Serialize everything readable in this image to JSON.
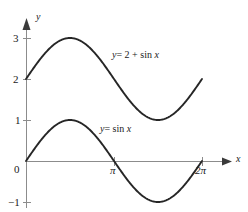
{
  "figure": {
    "kind": "math-plot",
    "background_color": "#ffffff",
    "stroke_color": "#262626",
    "axis_color": "#8c8c8c",
    "text_color": "#1a1a1a"
  },
  "axes": {
    "x_axis_label": "x",
    "y_axis_label": "y",
    "x_ticks": [
      {
        "label": "π",
        "value": 3.1416
      },
      {
        "label": "2π",
        "value": 6.2832
      }
    ],
    "y_ticks": [
      {
        "label": "3",
        "value": 3
      },
      {
        "label": "2",
        "value": 2
      },
      {
        "label": "1",
        "value": 1
      },
      {
        "label": "0",
        "value": 0
      },
      {
        "label": "−1",
        "value": -1
      }
    ]
  },
  "chart_data": {
    "type": "line",
    "title": "",
    "subtitle": "",
    "xlabel": "x",
    "ylabel": "y",
    "xlim": [
      0,
      6.2832
    ],
    "ylim": [
      -1.35,
      3.35
    ],
    "xticks": [
      3.1416,
      6.2832
    ],
    "xticklabels": [
      "π",
      "2π"
    ],
    "yticks": [
      -1,
      0,
      1,
      2,
      3
    ],
    "yticklabels": [
      "−1",
      "0",
      "1",
      "2",
      "3"
    ],
    "grid": false,
    "legend": "inline-annotations",
    "series": [
      {
        "name": "y = 2 + sin x",
        "expression": "2 + sin(x)",
        "color": "#262626",
        "amplitude": 1,
        "vertical_shift": 2,
        "x": [
          0,
          0.3927,
          0.7854,
          1.1781,
          1.5708,
          1.9635,
          2.3562,
          2.7489,
          3.1416,
          3.5343,
          3.927,
          4.3197,
          4.7124,
          5.1051,
          5.4978,
          5.8905,
          6.2832
        ],
        "y": [
          2,
          2.3827,
          2.7071,
          2.9239,
          3,
          2.9239,
          2.7071,
          2.3827,
          2,
          1.6173,
          1.2929,
          1.0761,
          1,
          1.0761,
          1.2929,
          1.6173,
          2
        ]
      },
      {
        "name": "y = sin x",
        "expression": "sin(x)",
        "color": "#262626",
        "amplitude": 1,
        "vertical_shift": 0,
        "x": [
          0,
          0.3927,
          0.7854,
          1.1781,
          1.5708,
          1.9635,
          2.3562,
          2.7489,
          3.1416,
          3.5343,
          3.927,
          4.3197,
          4.7124,
          5.1051,
          5.4978,
          5.8905,
          6.2832
        ],
        "y": [
          0,
          0.3827,
          0.7071,
          0.9239,
          1,
          0.9239,
          0.7071,
          0.3827,
          0,
          -0.3827,
          -0.7071,
          -0.9239,
          -1,
          -0.9239,
          -0.7071,
          -0.3827,
          0
        ]
      }
    ],
    "annotations": [
      {
        "text": "y = 2 + sin x",
        "x": 2.05,
        "y": 2.6
      },
      {
        "text": "y = sin x",
        "x": 1.85,
        "y": 0.88
      }
    ]
  },
  "labels": {
    "upper_curve": {
      "lead": "y",
      "equals": "= 2 +",
      "func": "sin",
      "var": "x"
    },
    "lower_curve": {
      "lead": "y",
      "equals": "=",
      "func": "sin",
      "var": "x"
    }
  }
}
